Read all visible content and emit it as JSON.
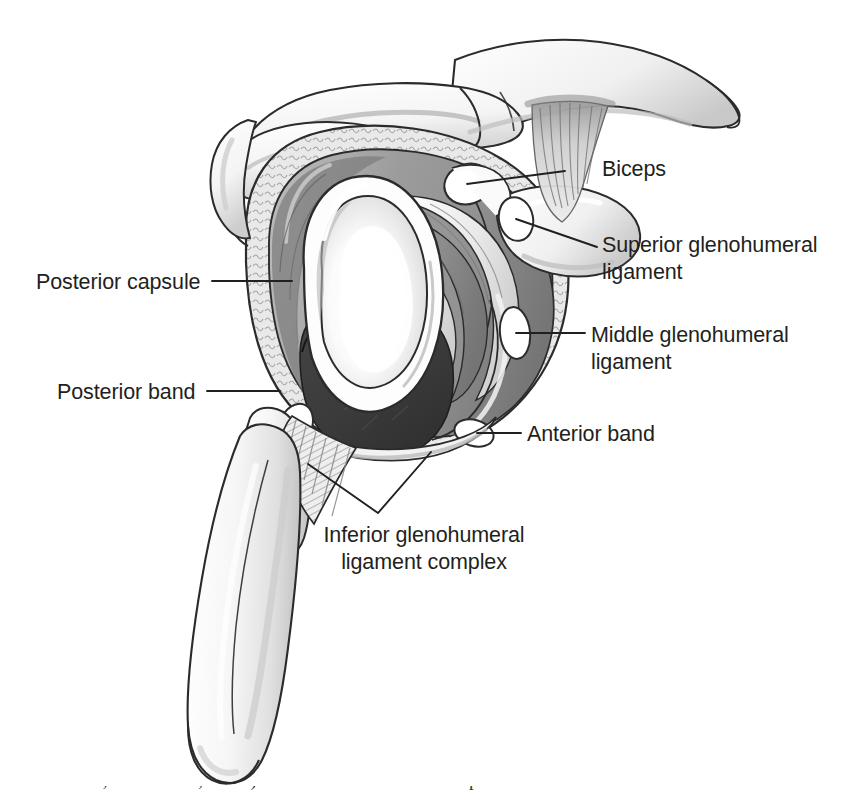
{
  "figure": {
    "background_color": "#ffffff",
    "width": 841,
    "height": 796
  },
  "palette": {
    "ink": "#231f20",
    "outline": "#2b2b2b",
    "bone_light": "#fbfbfb",
    "bone_shade": "#d6d6d6",
    "ligament_gray": "#8d8d8d",
    "ligament_gray_dark": "#6f6f6f",
    "ligament_light": "#efefef",
    "capsule_gray": "#9a9a9a",
    "recess_dark": "#3a3a3a",
    "glenoid_white": "#ffffff",
    "glenoid_shade": "#dcdcdc",
    "leader_line": "#231f20"
  },
  "labels": [
    {
      "id": "biceps",
      "text": "Biceps",
      "side": "right",
      "x": 602,
      "y": 156,
      "leader": {
        "x1": 565,
        "y1": 171,
        "x2": 467,
        "y2": 184
      }
    },
    {
      "id": "superior-glenohumeral-ligament",
      "text": "Superior glenohumeral\nligament",
      "side": "right",
      "x": 602,
      "y": 232,
      "leader": {
        "x1": 597,
        "y1": 247,
        "x2": 516,
        "y2": 219
      }
    },
    {
      "id": "middle-glenohumeral-ligament",
      "text": "Middle glenohumeral\nligament",
      "side": "right",
      "x": 591,
      "y": 322,
      "leader": {
        "x1": 585,
        "y1": 333,
        "x2": 516,
        "y2": 333
      }
    },
    {
      "id": "anterior-band",
      "text": "Anterior band",
      "side": "right",
      "x": 527,
      "y": 421,
      "leader": {
        "x1": 521,
        "y1": 433,
        "x2": 477,
        "y2": 433
      }
    },
    {
      "id": "posterior-capsule",
      "text": "Posterior capsule",
      "side": "left",
      "x": 36,
      "y": 269,
      "leader": {
        "x1": 212,
        "y1": 281,
        "x2": 292,
        "y2": 281
      }
    },
    {
      "id": "posterior-band",
      "text": "Posterior band",
      "side": "left",
      "x": 57,
      "y": 379,
      "leader": {
        "x1": 207,
        "y1": 391,
        "x2": 280,
        "y2": 391
      }
    },
    {
      "id": "inferior-glenohumeral-ligament-complex",
      "text": "Inferior glenohumeral\nligament complex",
      "side": "center",
      "x": 311,
      "y": 522,
      "width": 226,
      "bracket": {
        "apex_x": 378,
        "apex_y": 513,
        "left_x": 308,
        "left_y": 464,
        "right_x": 431,
        "right_y": 452
      }
    }
  ],
  "anatomy_parts": [
    "acromion",
    "clavicle",
    "acromioclavicular-joint",
    "coracoid-process",
    "coracoacromial-ligament-fibers",
    "biceps-tendon-cut-end",
    "superior-glenohumeral-ligament-cut-end",
    "middle-glenohumeral-ligament-cut-end",
    "anterior-band-cut-end",
    "posterior-band",
    "glenoid-fossa",
    "glenoid-labrum",
    "axillary-recess",
    "posterior-capsule",
    "scapular-neck",
    "scapular-lateral-border",
    "inferior-angle"
  ],
  "caption": {
    "text": "Moore, 2nd edition, 1992.) The anterior and inferior aspects of the inferior"
  }
}
